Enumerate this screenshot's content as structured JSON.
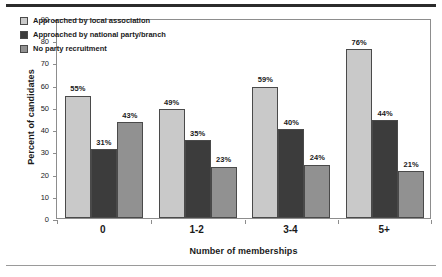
{
  "chart_data": {
    "type": "bar",
    "title": "",
    "xlabel": "Number of memberships",
    "ylabel": "Percent of candidates",
    "categories": [
      "0",
      "1-2",
      "3-4",
      "5+"
    ],
    "series": [
      {
        "name": "Approached by local association",
        "color": "#c9c9c9",
        "values": [
          55,
          49,
          59,
          76
        ],
        "labels": [
          "55%",
          "49%",
          "59%",
          "76%"
        ]
      },
      {
        "name": "Approached by national party/branch",
        "color": "#3c3c3c",
        "values": [
          31,
          35,
          40,
          44
        ],
        "labels": [
          "31%",
          "35%",
          "40%",
          "44%"
        ]
      },
      {
        "name": "No party recruitment",
        "color": "#919191",
        "values": [
          43,
          23,
          24,
          21
        ],
        "labels": [
          "43%",
          "23%",
          "24%",
          "21%"
        ]
      }
    ],
    "ylim": [
      0,
      90
    ],
    "ytick_values": [
      0,
      10,
      20,
      30,
      40,
      50,
      60,
      70,
      80,
      90
    ],
    "ytick_labels": [
      "0",
      "10",
      "20",
      "30",
      "40",
      "50",
      "60",
      "70",
      "80",
      "90"
    ],
    "grid": false,
    "legend_position": "top-left",
    "value_suffix": "%"
  },
  "legend": {
    "items": [
      {
        "label": "Approached by local association",
        "color": "#c9c9c9"
      },
      {
        "label": "Approached by national party/branch",
        "color": "#3c3c3c"
      },
      {
        "label": "No party recruitment",
        "color": "#919191"
      }
    ]
  }
}
